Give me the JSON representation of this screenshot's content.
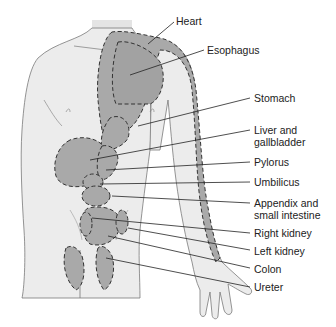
{
  "diagram": {
    "colors": {
      "body_fill": "#ececec",
      "body_outline": "#7a7a7a",
      "region_fill": "#a9a9a9",
      "dash_stroke": "#333333",
      "leader_line": "#222222"
    },
    "labels": [
      {
        "id": "heart",
        "text": "Heart",
        "line2": ""
      },
      {
        "id": "esophagus",
        "text": "Esophagus",
        "line2": ""
      },
      {
        "id": "stomach",
        "text": "Stomach",
        "line2": ""
      },
      {
        "id": "liver",
        "text": "Liver and",
        "line2": "gallbladder"
      },
      {
        "id": "pylorus",
        "text": "Pylorus",
        "line2": ""
      },
      {
        "id": "umbilicus",
        "text": "Umbilicus",
        "line2": ""
      },
      {
        "id": "appendix",
        "text": "Appendix and",
        "line2": "small intestine"
      },
      {
        "id": "right-kidney",
        "text": "Right kidney",
        "line2": ""
      },
      {
        "id": "left-kidney",
        "text": "Left kidney",
        "line2": ""
      },
      {
        "id": "colon",
        "text": "Colon",
        "line2": ""
      },
      {
        "id": "ureter",
        "text": "Ureter",
        "line2": ""
      }
    ]
  }
}
